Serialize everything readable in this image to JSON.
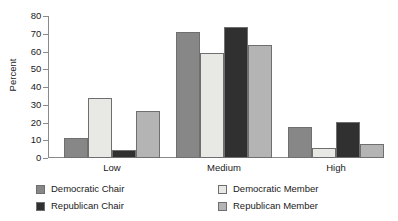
{
  "chart_data": {
    "type": "bar",
    "title": "",
    "subtitle": "",
    "xlabel": "",
    "ylabel": "Percent",
    "ylim": [
      0,
      80
    ],
    "yticks": [
      0,
      10,
      20,
      30,
      40,
      50,
      60,
      70,
      80
    ],
    "grid": false,
    "legend_position": "bottom",
    "categories": [
      "Low",
      "Medium",
      "High"
    ],
    "series": [
      {
        "name": "Democratic Chair",
        "color": "#878787",
        "values": [
          11,
          71,
          17.5
        ]
      },
      {
        "name": "Democratic Member",
        "color": "#e8e8e5",
        "values": [
          34,
          59,
          5.5
        ]
      },
      {
        "name": "Republican Chair",
        "color": "#303030",
        "values": [
          4.5,
          74,
          20.5
        ]
      },
      {
        "name": "Republican Member",
        "color": "#b4b4b4",
        "values": [
          26.5,
          63.5,
          8
        ]
      }
    ]
  },
  "axis": {
    "y_title": "Percent",
    "tick_labels": [
      "0",
      "10",
      "20",
      "30",
      "40",
      "50",
      "60",
      "70",
      "80"
    ],
    "category_labels": [
      "Low",
      "Medium",
      "High"
    ]
  },
  "legend": {
    "entries": [
      {
        "label": "Democratic Chair",
        "color": "#878787"
      },
      {
        "label": "Republican Chair",
        "color": "#303030"
      },
      {
        "label": "Democratic Member",
        "color": "#e8e8e5"
      },
      {
        "label": "Republican Member",
        "color": "#b4b4b4"
      }
    ]
  },
  "style": {
    "axis_color": "#8a8a8a",
    "bar_border": "#6f6f6f",
    "text_color": "#1a1a1a",
    "background": "#ffffff"
  }
}
